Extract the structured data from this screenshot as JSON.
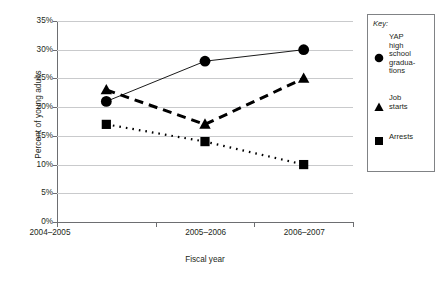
{
  "chart_data": {
    "type": "line",
    "title": "",
    "xlabel": "Fiscal year",
    "ylabel": "Percent of young adults",
    "categories": [
      "2004–2005",
      "2005–2006",
      "2006–2007"
    ],
    "ylim": [
      0,
      35
    ],
    "ytick_labels": [
      "0%",
      "5%",
      "10%",
      "15%",
      "20%",
      "25%",
      "30%",
      "35%"
    ],
    "ytick_values": [
      0,
      5,
      10,
      15,
      20,
      25,
      30,
      35
    ],
    "grid": true,
    "legend_position": "right-outside",
    "series": [
      {
        "name": "YAP high school gradua-\ntions",
        "marker": "circle",
        "line_style": "solid",
        "values": [
          21,
          28,
          30
        ]
      },
      {
        "name": "Job starts",
        "marker": "triangle",
        "line_style": "dashed",
        "values": [
          23,
          17,
          25
        ]
      },
      {
        "name": "Arrests",
        "marker": "square",
        "line_style": "dotted",
        "values": [
          17,
          14,
          10
        ]
      }
    ]
  },
  "axes": {
    "y_title": "Percent of young adults",
    "x_title": "Fiscal year",
    "y_ticks": [
      "35%",
      "30%",
      "25%",
      "20%",
      "15%",
      "10%",
      "5%",
      "0%"
    ],
    "x_ticks": [
      "2004–2005",
      "2005–2006",
      "2006–2007"
    ]
  },
  "legend": {
    "title": "Key:",
    "entries": [
      {
        "label": "YAP\nhigh\nschool\ngradua-\ntions",
        "marker": "circle-marker"
      },
      {
        "label": "Job\nstarts",
        "marker": "triangle-marker"
      },
      {
        "label": "Arrests",
        "marker": "square-marker"
      }
    ]
  },
  "colors": {
    "ink": "#231f20",
    "grid": "#c9cacc",
    "axis": "#6d6e71",
    "marker": "#000000"
  }
}
